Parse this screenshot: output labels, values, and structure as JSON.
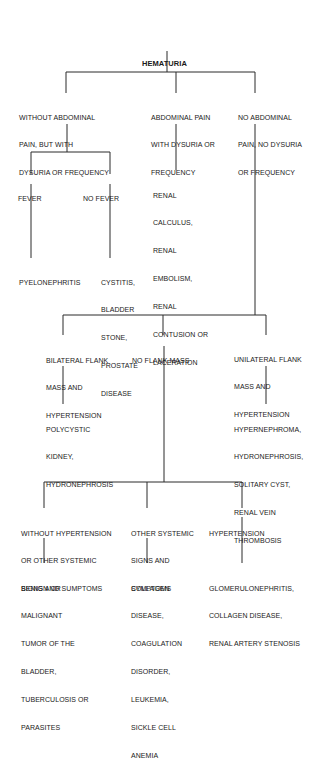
{
  "title": "HEMATURIA",
  "level1": [
    {
      "id": "without-abdominal-pain",
      "lines": [
        "WITHOUT ABDOMINAL",
        "PAIN, BUT WITH",
        "DYSURIA OR FREQUENCY"
      ]
    },
    {
      "id": "abdominal-pain",
      "lines": [
        "ABDOMINAL PAIN",
        "WITH DYSURIA OR",
        "FREQUENCY"
      ]
    },
    {
      "id": "no-abdominal-pain",
      "lines": [
        "NO ABDOMINAL",
        "PAIN, NO DYSURIA",
        "OR FREQUENCY"
      ]
    }
  ],
  "fever_branch": [
    {
      "id": "fever",
      "lines": [
        "FEVER"
      ]
    },
    {
      "id": "no-fever",
      "lines": [
        "NO FEVER"
      ]
    }
  ],
  "results_1": {
    "abdominal_pain": [
      "RENAL",
      "CALCULUS,",
      "RENAL",
      "EMBOLISM,",
      "RENAL",
      "CONTUSION OR",
      "LACERATION"
    ],
    "fever": [
      "PYELONEPHRITIS"
    ],
    "no_fever": [
      "CYSTITIS,",
      "BLADDER",
      "STONE,",
      "PROSTATE",
      "DISEASE"
    ]
  },
  "flank_branch": [
    {
      "id": "bilateral-flank-mass",
      "lines": [
        "BILATERAL FLANK",
        "MASS AND",
        "HYPERTENSION"
      ]
    },
    {
      "id": "no-flank-mass",
      "lines": [
        "NO FLANK MASS"
      ]
    },
    {
      "id": "unilateral-flank-mass",
      "lines": [
        "UNILATERAL FLANK",
        "MASS AND",
        "HYPERTENSION"
      ]
    }
  ],
  "results_2": {
    "bilateral": [
      "POLYCYSTIC",
      "KIDNEY,",
      "HYDRONEPHROSIS"
    ],
    "unilateral": [
      "HYPERNEPHROMA,",
      "HYDRONEPHROSIS,",
      "SOLITARY CYST,",
      "RENAL VEIN",
      "THROMBOSIS"
    ]
  },
  "systemic_branch": [
    {
      "id": "without-hypertension",
      "lines": [
        "WITHOUT HYPERTENSION",
        "OR OTHER SYSTEMIC",
        "SIGNS AND SUMPTOMS"
      ]
    },
    {
      "id": "other-systemic-signs",
      "lines": [
        "OTHER SYSTEMIC",
        "SIGNS AND",
        "SYMPTOMS"
      ]
    },
    {
      "id": "hypertension",
      "lines": [
        "HYPERTENSION"
      ]
    }
  ],
  "results_3": {
    "without_hypertension": [
      "BENIGN OR",
      "MALIGNANT",
      "TUMOR OF THE",
      "BLADDER,",
      "TUBERCULOSIS OR",
      "PARASITES"
    ],
    "other_systemic": [
      "COLLAGEN",
      "DISEASE,",
      "COAGULATION",
      "DISORDER,",
      "LEUKEMIA,",
      "SICKLE CELL",
      "ANEMIA"
    ],
    "hypertension": [
      "GLOMERULONEPHRITIS,",
      "COLLAGEN DISEASE,",
      "RENAL ARTERY STENOSIS"
    ]
  }
}
